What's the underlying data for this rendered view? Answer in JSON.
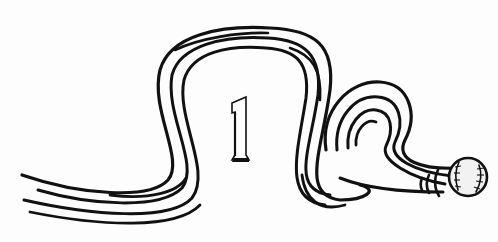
{
  "illustration": {
    "subject": "baseball pitch trajectory",
    "numeral": "1",
    "colors": {
      "ink": "#111111",
      "background": "#fdfdfd",
      "ball_fill": "#f2f2f2"
    },
    "icons": [
      "motion-lines-icon",
      "baseball-icon"
    ]
  }
}
